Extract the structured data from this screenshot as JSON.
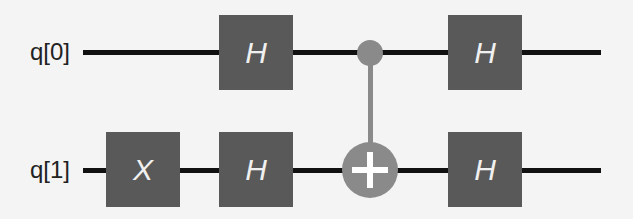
{
  "circuit": {
    "qubits": [
      {
        "label": "q[0]"
      },
      {
        "label": "q[1]"
      }
    ],
    "gates": [
      {
        "type": "H",
        "qubit": 0,
        "step": 1,
        "label": "H"
      },
      {
        "type": "X",
        "qubit": 1,
        "step": 0,
        "label": "X"
      },
      {
        "type": "H",
        "qubit": 1,
        "step": 1,
        "label": "H"
      },
      {
        "type": "CNOT",
        "control": 0,
        "target": 1,
        "step": 2
      },
      {
        "type": "H",
        "qubit": 0,
        "step": 3,
        "label": "H"
      },
      {
        "type": "H",
        "qubit": 1,
        "step": 3,
        "label": "H"
      }
    ],
    "colors": {
      "gate": "#595959",
      "cnot": "#8a8a8a",
      "wire": "#111111"
    }
  }
}
